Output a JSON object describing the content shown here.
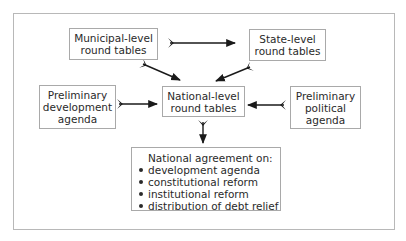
{
  "diagram": {
    "nodes": {
      "municipal": {
        "line1": "Municipal-level",
        "line2": "round tables"
      },
      "state": {
        "line1": "State-level",
        "line2": "round tables"
      },
      "prelim_dev": {
        "line1": "Preliminary",
        "line2": "development",
        "line3": "agenda"
      },
      "national": {
        "line1": "National-level",
        "line2": "round tables"
      },
      "prelim_pol": {
        "line1": "Preliminary",
        "line2": "political",
        "line3": "agenda"
      },
      "agreement": {
        "header": "National agreement on:",
        "items": [
          "development agenda",
          "constitutional reform",
          "institutional reform",
          "distribution of debt relief"
        ]
      }
    },
    "edges": [
      {
        "from": "municipal",
        "to": "state"
      },
      {
        "from": "municipal",
        "to": "national"
      },
      {
        "from": "state",
        "to": "national"
      },
      {
        "from": "prelim_dev",
        "to": "national"
      },
      {
        "from": "prelim_pol",
        "to": "national"
      },
      {
        "from": "national",
        "to": "agreement"
      }
    ],
    "colors": {
      "border": "#a9a9a9",
      "frame": "#b8b8b8",
      "text": "#2a2a2a",
      "arrow": "#1a1a1a"
    }
  }
}
